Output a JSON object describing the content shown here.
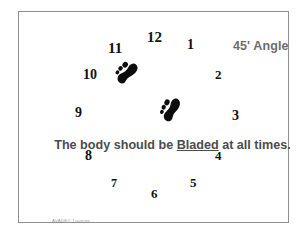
{
  "slide": {
    "title": "45' Angle",
    "instruction": {
      "before": "The body should be ",
      "emphasis": "Bladed",
      "after": " at all times."
    },
    "footer": "AVADE® Training",
    "border_color": "#8f8f8f",
    "background_color": "#ffffff",
    "title_color": "#6d6d6d",
    "instruction_color": "#4c4c4c",
    "numeral_color": "#111111"
  },
  "clock": {
    "numerals": [
      {
        "label": "12",
        "x": 146,
        "y": 29,
        "size": 15
      },
      {
        "label": "1",
        "x": 186,
        "y": 37,
        "size": 14
      },
      {
        "label": "2",
        "x": 214,
        "y": 67,
        "size": 13
      },
      {
        "label": "3",
        "x": 231,
        "y": 108,
        "size": 14
      },
      {
        "label": "4",
        "x": 214,
        "y": 148,
        "size": 13
      },
      {
        "label": "5",
        "x": 189,
        "y": 175,
        "size": 13
      },
      {
        "label": "6",
        "x": 150,
        "y": 186,
        "size": 13
      },
      {
        "label": "7",
        "x": 110,
        "y": 176,
        "size": 12
      },
      {
        "label": "8",
        "x": 84,
        "y": 148,
        "size": 14
      },
      {
        "label": "9",
        "x": 74,
        "y": 105,
        "size": 14
      },
      {
        "label": "10",
        "x": 82,
        "y": 67,
        "size": 14
      },
      {
        "label": "11",
        "x": 107,
        "y": 40,
        "size": 15
      }
    ],
    "footprints": [
      {
        "name": "left-footprint",
        "x": 113,
        "y": 58,
        "width": 24,
        "height": 26,
        "rotation": 40
      },
      {
        "name": "right-footprint",
        "x": 158,
        "y": 95,
        "width": 22,
        "height": 26,
        "rotation": 22
      }
    ]
  }
}
